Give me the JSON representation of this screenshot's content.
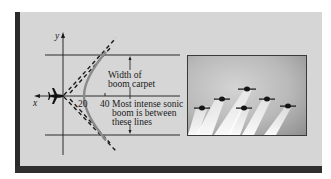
{
  "figure": {
    "axes": {
      "x_label": "x",
      "y_label": "y",
      "ticks": [
        "20",
        "40"
      ]
    },
    "annotations": {
      "width_label_line1": "Width of",
      "width_label_line2": "boom carpet",
      "intense_line1": "Most intense sonic",
      "intense_line2": "boom is between",
      "intense_line3": "these lines"
    },
    "photo": {
      "description": "Six jet aircraft flying in formation trailing white smoke",
      "aircraft_count": 6
    },
    "colors": {
      "panel_background": "#d6d6d6",
      "frame_dark": "#2a2a2a",
      "curve_gray": "#8a8a8a",
      "line_black": "#1a1a1a"
    }
  }
}
